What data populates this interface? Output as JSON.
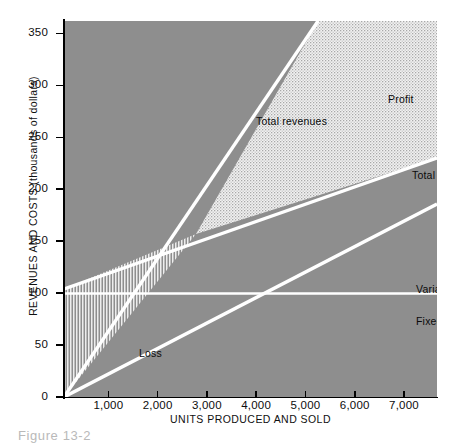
{
  "caption": "Figure 13-2",
  "chart_data": {
    "type": "line",
    "title": "",
    "xlabel": "UNITS PRODUCED AND SOLD",
    "ylabel": "REVENUES AND COSTS (thousands of dollars)",
    "xlim": [
      100,
      7670
    ],
    "ylim": [
      0,
      362
    ],
    "grid": false,
    "legend_position": "inline-annotations",
    "xticks": [
      1000,
      2000,
      3000,
      4000,
      5000,
      6000,
      7000
    ],
    "xtick_labels": [
      "1,000",
      "2,000",
      "3,000",
      "4,000",
      "5,000",
      "6,000",
      "7,000"
    ],
    "yticks": [
      0,
      50,
      100,
      150,
      200,
      250,
      300,
      350
    ],
    "ytick_labels": [
      "0",
      "50",
      "100",
      "150",
      "200",
      "250",
      "300",
      "350"
    ],
    "plot_background_color": "#8e8e8e",
    "line_color": "#ffffff",
    "series": [
      {
        "name": "Total revenues",
        "label": "Total revenues",
        "x": [
          100,
          7670
        ],
        "values": [
          0,
          575
        ],
        "slope_per_unit": 0.075,
        "intercept": -7.5
      },
      {
        "name": "Total costs",
        "label": "Total costs",
        "x": [
          100,
          7670
        ],
        "values": [
          103,
          230
        ],
        "slope_per_unit": 0.0168,
        "intercept": 101.3
      },
      {
        "name": "Variable costs",
        "label": "Variable costs",
        "x": [
          100,
          7670
        ],
        "values": [
          0,
          186
        ],
        "slope_per_unit": 0.0246,
        "intercept": -2.46
      },
      {
        "name": "Fixed costs",
        "label": "Fixed costs",
        "x": [
          100,
          7670
        ],
        "values": [
          100,
          100
        ],
        "slope_per_unit": 0,
        "intercept": 100
      }
    ],
    "regions": [
      {
        "name": "Profit",
        "label": "Profit",
        "fill": "dotted-stipple"
      },
      {
        "name": "Loss",
        "label": "Loss",
        "fill": "vertical-hatch"
      }
    ],
    "breakeven": {
      "units": 2780,
      "amount": 158
    }
  }
}
